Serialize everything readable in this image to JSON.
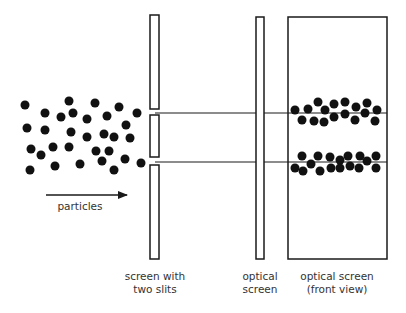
{
  "diagram": {
    "colors": {
      "stroke": "#1a1a1a",
      "dot": "#111111",
      "text": "#333333",
      "background": "#ffffff"
    },
    "particles": {
      "label": "particles",
      "arrow": {
        "x1": 46,
        "x2": 127,
        "y": 195
      },
      "dot_radius": 4.5,
      "dots": [
        [
          25,
          105
        ],
        [
          69,
          101
        ],
        [
          95,
          103
        ],
        [
          119,
          107
        ],
        [
          137,
          113
        ],
        [
          45,
          113
        ],
        [
          61,
          117
        ],
        [
          73,
          113
        ],
        [
          87,
          119
        ],
        [
          107,
          116
        ],
        [
          126,
          125
        ],
        [
          27,
          128
        ],
        [
          45,
          130
        ],
        [
          71,
          132
        ],
        [
          87,
          137
        ],
        [
          104,
          134
        ],
        [
          114,
          137
        ],
        [
          130,
          138
        ],
        [
          31,
          149
        ],
        [
          41,
          155
        ],
        [
          53,
          147
        ],
        [
          69,
          147
        ],
        [
          96,
          151
        ],
        [
          109,
          151
        ],
        [
          30,
          170
        ],
        [
          55,
          166
        ],
        [
          80,
          164
        ],
        [
          102,
          161
        ],
        [
          114,
          170
        ],
        [
          125,
          159
        ],
        [
          141,
          163
        ]
      ]
    },
    "slit_screen": {
      "label_line1": "screen with",
      "label_line2": "two slits",
      "x": 150,
      "width": 9,
      "segments": [
        [
          15,
          109
        ],
        [
          115,
          157
        ],
        [
          165,
          259
        ]
      ],
      "slit_y": [
        112,
        161
      ]
    },
    "beam_lines": [
      {
        "y": 113,
        "x1": 155,
        "x2": 387
      },
      {
        "y": 162,
        "x1": 155,
        "x2": 387
      }
    ],
    "optical_screen": {
      "label_line1": "optical",
      "label_line2": "screen",
      "x": 256,
      "y": 17,
      "width": 8,
      "height": 242
    },
    "front_view": {
      "label_line1": "optical screen",
      "label_line2": "(front view)",
      "x": 288,
      "y": 17,
      "width": 99,
      "height": 242,
      "dot_radius": 4.5,
      "top_band": [
        [
          295,
          110
        ],
        [
          308,
          109
        ],
        [
          318,
          102
        ],
        [
          325,
          110
        ],
        [
          334,
          104
        ],
        [
          345,
          102
        ],
        [
          356,
          107
        ],
        [
          367,
          103
        ],
        [
          377,
          110
        ],
        [
          302,
          120
        ],
        [
          314,
          121
        ],
        [
          324,
          122
        ],
        [
          334,
          117
        ],
        [
          345,
          114
        ],
        [
          355,
          120
        ],
        [
          365,
          113
        ],
        [
          375,
          121
        ]
      ],
      "bottom_band": [
        [
          302,
          156
        ],
        [
          318,
          156
        ],
        [
          330,
          157
        ],
        [
          340,
          160
        ],
        [
          348,
          156
        ],
        [
          360,
          156
        ],
        [
          367,
          161
        ],
        [
          376,
          156
        ],
        [
          295,
          168
        ],
        [
          303,
          171
        ],
        [
          311,
          164
        ],
        [
          320,
          171
        ],
        [
          331,
          168
        ],
        [
          340,
          168
        ],
        [
          350,
          166
        ],
        [
          359,
          168
        ],
        [
          376,
          168
        ]
      ]
    }
  }
}
